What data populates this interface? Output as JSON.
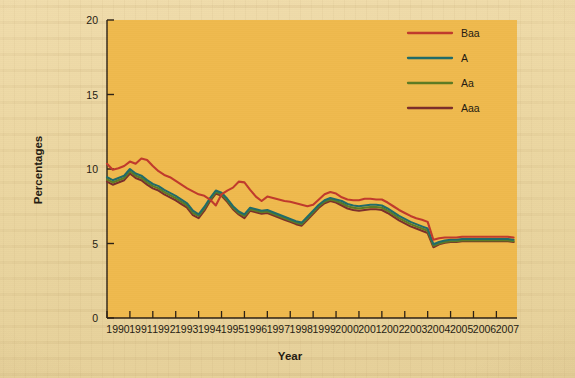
{
  "page": {
    "background_color": "#ecd7a2",
    "plot_background_color": "#efb94d"
  },
  "chart_data": {
    "type": "line",
    "title": "",
    "xlabel": "Year",
    "ylabel": "Percentages",
    "xlim": [
      1990,
      2007.9
    ],
    "ylim": [
      0,
      20
    ],
    "yticks": [
      0,
      5,
      10,
      15,
      20
    ],
    "ytick_labels": [
      "0",
      "5",
      "10",
      "15",
      "20"
    ],
    "xticks": [
      1990,
      1991,
      1992,
      1993,
      1994,
      1995,
      1996,
      1997,
      1998,
      1999,
      2000,
      2001,
      2002,
      2003,
      2004,
      2005,
      2006,
      2007
    ],
    "xtick_labels": [
      "1990",
      "1991",
      "1992",
      "1993",
      "1994",
      "1995",
      "1996",
      "1997",
      "1998",
      "1999",
      "2000",
      "2001",
      "2002",
      "2003",
      "2004",
      "2005",
      "2006",
      "2007"
    ],
    "grid": false,
    "legend_position": "top-right",
    "x": [
      1990.0,
      1990.25,
      1990.5,
      1990.75,
      1991.0,
      1991.25,
      1991.5,
      1991.75,
      1992.0,
      1992.25,
      1992.5,
      1992.75,
      1993.0,
      1993.25,
      1993.5,
      1993.75,
      1994.0,
      1994.25,
      1994.5,
      1994.75,
      1995.0,
      1995.25,
      1995.5,
      1995.75,
      1996.0,
      1996.25,
      1996.5,
      1996.75,
      1997.0,
      1997.25,
      1997.5,
      1997.75,
      1998.0,
      1998.25,
      1998.5,
      1998.75,
      1999.0,
      1999.25,
      1999.5,
      1999.75,
      2000.0,
      2000.25,
      2000.5,
      2000.75,
      2001.0,
      2001.25,
      2001.5,
      2001.75,
      2002.0,
      2002.25,
      2002.5,
      2002.75,
      2003.0,
      2003.25,
      2003.5,
      2003.75,
      2004.0,
      2004.25,
      2004.5,
      2004.75,
      2005.0,
      2005.25,
      2005.5,
      2005.75,
      2006.0,
      2006.25,
      2006.5,
      2006.75,
      2007.0,
      2007.25,
      2007.5,
      2007.75
    ],
    "series": [
      {
        "name": "Baa",
        "color": "#c0392b",
        "values": [
          10.35,
          9.95,
          10.05,
          10.2,
          10.5,
          10.35,
          10.7,
          10.6,
          10.2,
          9.85,
          9.6,
          9.45,
          9.2,
          8.95,
          8.7,
          8.5,
          8.3,
          8.2,
          7.95,
          7.55,
          8.3,
          8.55,
          8.75,
          9.15,
          9.1,
          8.6,
          8.15,
          7.85,
          8.15,
          8.05,
          7.95,
          7.85,
          7.8,
          7.7,
          7.6,
          7.5,
          7.6,
          7.95,
          8.3,
          8.45,
          8.35,
          8.1,
          7.95,
          7.9,
          7.9,
          8.0,
          8.0,
          7.95,
          7.95,
          7.75,
          7.5,
          7.25,
          7.05,
          6.85,
          6.7,
          6.6,
          6.45,
          5.25,
          5.35,
          5.4,
          5.4,
          5.4,
          5.45,
          5.45,
          5.45,
          5.45,
          5.45,
          5.45,
          5.45,
          5.45,
          5.45,
          5.4
        ]
      },
      {
        "name": "A",
        "color": "#1f6b68",
        "values": [
          9.45,
          9.25,
          9.4,
          9.55,
          10.0,
          9.7,
          9.55,
          9.25,
          9.0,
          8.85,
          8.6,
          8.4,
          8.2,
          7.95,
          7.7,
          7.2,
          6.95,
          7.45,
          8.05,
          8.55,
          8.4,
          8.0,
          7.5,
          7.15,
          6.95,
          7.4,
          7.3,
          7.2,
          7.25,
          7.1,
          6.95,
          6.8,
          6.65,
          6.5,
          6.4,
          6.8,
          7.2,
          7.6,
          7.9,
          8.05,
          7.95,
          7.85,
          7.65,
          7.55,
          7.5,
          7.55,
          7.6,
          7.6,
          7.55,
          7.35,
          7.1,
          6.85,
          6.65,
          6.45,
          6.3,
          6.15,
          6.0,
          4.95,
          5.1,
          5.2,
          5.25,
          5.25,
          5.3,
          5.3,
          5.3,
          5.3,
          5.3,
          5.3,
          5.3,
          5.3,
          5.3,
          5.25
        ]
      },
      {
        "name": "Aa",
        "color": "#5c7a22",
        "values": [
          9.3,
          9.1,
          9.25,
          9.4,
          9.85,
          9.55,
          9.4,
          9.1,
          8.85,
          8.7,
          8.45,
          8.25,
          8.05,
          7.8,
          7.55,
          7.05,
          6.85,
          7.35,
          7.95,
          8.45,
          8.3,
          7.9,
          7.4,
          7.05,
          6.85,
          7.3,
          7.2,
          7.1,
          7.15,
          7.0,
          6.85,
          6.7,
          6.55,
          6.4,
          6.3,
          6.7,
          7.1,
          7.5,
          7.8,
          7.95,
          7.85,
          7.7,
          7.5,
          7.4,
          7.35,
          7.4,
          7.45,
          7.45,
          7.4,
          7.2,
          6.95,
          6.7,
          6.5,
          6.3,
          6.15,
          6.0,
          5.85,
          4.85,
          5.0,
          5.1,
          5.15,
          5.15,
          5.2,
          5.2,
          5.2,
          5.2,
          5.2,
          5.2,
          5.2,
          5.2,
          5.2,
          5.15
        ]
      },
      {
        "name": "Aaa",
        "color": "#7b2d2a",
        "values": [
          9.15,
          8.95,
          9.1,
          9.25,
          9.7,
          9.4,
          9.25,
          8.95,
          8.7,
          8.55,
          8.3,
          8.1,
          7.9,
          7.65,
          7.4,
          6.9,
          6.7,
          7.2,
          7.85,
          8.35,
          8.2,
          7.8,
          7.3,
          6.95,
          6.7,
          7.2,
          7.1,
          7.0,
          7.05,
          6.9,
          6.75,
          6.6,
          6.45,
          6.3,
          6.2,
          6.6,
          7.0,
          7.4,
          7.7,
          7.85,
          7.75,
          7.55,
          7.35,
          7.25,
          7.2,
          7.25,
          7.3,
          7.3,
          7.25,
          7.05,
          6.8,
          6.55,
          6.35,
          6.15,
          6.0,
          5.85,
          5.7,
          4.75,
          4.95,
          5.05,
          5.1,
          5.1,
          5.15,
          5.15,
          5.15,
          5.15,
          5.15,
          5.15,
          5.15,
          5.15,
          5.15,
          5.1
        ]
      }
    ],
    "legend": [
      {
        "label": "Baa",
        "color": "#c0392b"
      },
      {
        "label": "A",
        "color": "#1f6b68"
      },
      {
        "label": "Aa",
        "color": "#5c7a22"
      },
      {
        "label": "Aaa",
        "color": "#7b2d2a"
      }
    ]
  }
}
